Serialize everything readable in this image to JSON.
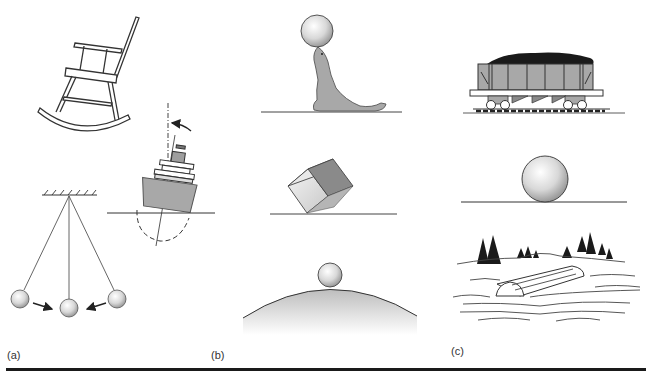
{
  "figure": {
    "panels": [
      {
        "id": "a",
        "label": "(a)",
        "items": [
          "rocking-chair",
          "tilting-ship",
          "pendulum"
        ]
      },
      {
        "id": "b",
        "label": "(b)",
        "items": [
          "seal-balancing-ball",
          "cube-on-edge",
          "ball-on-hill"
        ]
      },
      {
        "id": "c",
        "label": "(c)",
        "items": [
          "coal-hopper-car",
          "ball-on-flat-surface",
          "floating-log"
        ]
      }
    ],
    "colors": {
      "line": "#333333",
      "fill_gray": "#a8a8a8",
      "coal": "#1a1a1a",
      "rule": "#1a1a1a"
    }
  }
}
